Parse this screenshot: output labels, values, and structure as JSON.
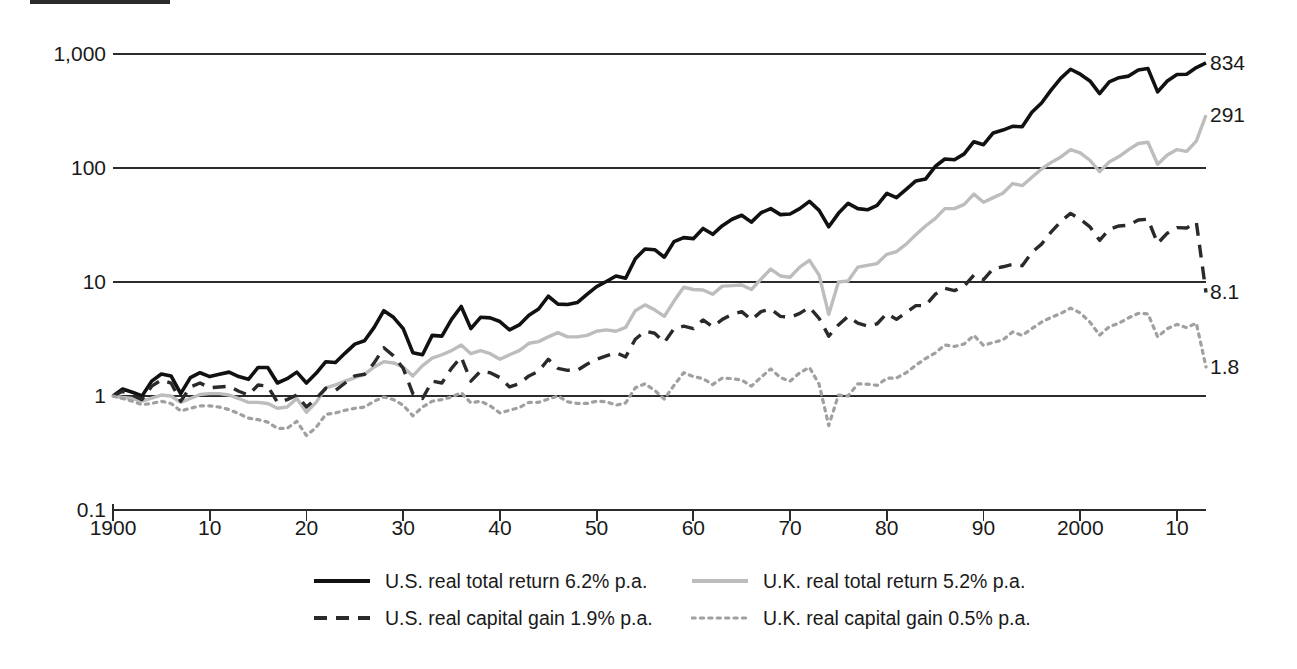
{
  "figure": {
    "top_rule": "decorative-rule"
  },
  "chart_data": {
    "type": "line",
    "title": "",
    "subtitle": "",
    "xlabel": "",
    "ylabel": "",
    "yscale": "log",
    "ylim": [
      0.1,
      1000
    ],
    "xlim": [
      1900,
      2013
    ],
    "grid": true,
    "legend_position": "bottom",
    "y_ticks": [
      0.1,
      1,
      10,
      100,
      1000
    ],
    "y_tick_labels": [
      "0.1",
      "1",
      "10",
      "100",
      "1,000"
    ],
    "x_ticks": [
      1900,
      1910,
      1920,
      1930,
      1940,
      1950,
      1960,
      1970,
      1980,
      1990,
      2000,
      2010
    ],
    "x_tick_labels": [
      "1900",
      "10",
      "20",
      "30",
      "40",
      "50",
      "60",
      "70",
      "80",
      "90",
      "2000",
      "10"
    ],
    "end_labels": [
      {
        "series": "U.S. real total return",
        "text": "834",
        "value": 834
      },
      {
        "series": "U.K. real total return",
        "text": "291",
        "value": 291
      },
      {
        "series": "U.S. real capital gain",
        "text": "8.1",
        "value": 8.1
      },
      {
        "series": "U.K. real capital gain",
        "text": "1.8",
        "value": 1.8
      }
    ],
    "x": [
      1900,
      1901,
      1902,
      1903,
      1904,
      1905,
      1906,
      1907,
      1908,
      1909,
      1910,
      1911,
      1912,
      1913,
      1914,
      1915,
      1916,
      1917,
      1918,
      1919,
      1920,
      1921,
      1922,
      1923,
      1924,
      1925,
      1926,
      1927,
      1928,
      1929,
      1930,
      1931,
      1932,
      1933,
      1934,
      1935,
      1936,
      1937,
      1938,
      1939,
      1940,
      1941,
      1942,
      1943,
      1944,
      1945,
      1946,
      1947,
      1948,
      1949,
      1950,
      1951,
      1952,
      1953,
      1954,
      1955,
      1956,
      1957,
      1958,
      1959,
      1960,
      1961,
      1962,
      1963,
      1964,
      1965,
      1966,
      1967,
      1968,
      1969,
      1970,
      1971,
      1972,
      1973,
      1974,
      1975,
      1976,
      1977,
      1978,
      1979,
      1980,
      1981,
      1982,
      1983,
      1984,
      1985,
      1986,
      1987,
      1988,
      1989,
      1990,
      1991,
      1992,
      1993,
      1994,
      1995,
      1996,
      1997,
      1998,
      1999,
      2000,
      2001,
      2002,
      2003,
      2004,
      2005,
      2006,
      2007,
      2008,
      2009,
      2010,
      2011,
      2012,
      2013
    ],
    "series": [
      {
        "name": "U.S. real total return 6.2% p.a.",
        "label": "U.S. real total return",
        "rate": "6.2% p.a.",
        "color": "#111111",
        "style": "solid",
        "width": 3.6,
        "values": [
          1,
          1.15,
          1.08,
          1.0,
          1.35,
          1.56,
          1.5,
          1.05,
          1.45,
          1.6,
          1.48,
          1.55,
          1.62,
          1.48,
          1.4,
          1.78,
          1.78,
          1.3,
          1.42,
          1.62,
          1.3,
          1.58,
          2.0,
          1.97,
          2.38,
          2.85,
          3.05,
          4.0,
          5.6,
          4.9,
          3.9,
          2.4,
          2.3,
          3.4,
          3.35,
          4.7,
          6.1,
          3.9,
          4.9,
          4.85,
          4.5,
          3.8,
          4.2,
          5.1,
          5.8,
          7.5,
          6.4,
          6.35,
          6.6,
          7.8,
          9.1,
          10.1,
          11.3,
          10.8,
          16.0,
          19.5,
          19.2,
          16.5,
          22.6,
          24.5,
          24.0,
          29.5,
          26.2,
          31.2,
          35.5,
          38.5,
          33.5,
          40.5,
          44.0,
          39.0,
          39.5,
          44.0,
          51.0,
          42.5,
          30.5,
          40.0,
          49.0,
          44.0,
          43.0,
          47.0,
          60.0,
          55.0,
          65.0,
          77.0,
          80.0,
          103.0,
          120.0,
          118.0,
          133.0,
          170.0,
          160.0,
          203.0,
          215.0,
          232.0,
          230.0,
          308.0,
          372.0,
          485.0,
          615.0,
          735.0,
          665.0,
          580.0,
          450.0,
          570.0,
          620.0,
          640.0,
          725.0,
          745.0,
          465.0,
          580.0,
          660.0,
          665.0,
          760.0,
          834.0
        ]
      },
      {
        "name": "U.K. real total return 5.2% p.a.",
        "label": "U.K. real total return",
        "rate": "5.2% p.a.",
        "color": "#bdbdbd",
        "style": "solid",
        "width": 3.4,
        "values": [
          1,
          0.97,
          0.95,
          0.9,
          0.96,
          1.02,
          1.0,
          0.88,
          0.95,
          1.03,
          1.05,
          1.05,
          1.02,
          0.95,
          0.88,
          0.88,
          0.86,
          0.78,
          0.8,
          0.95,
          0.72,
          0.88,
          1.18,
          1.25,
          1.35,
          1.45,
          1.55,
          1.8,
          2.0,
          1.95,
          1.8,
          1.5,
          1.85,
          2.15,
          2.3,
          2.5,
          2.8,
          2.35,
          2.5,
          2.35,
          2.1,
          2.3,
          2.5,
          2.9,
          3.0,
          3.3,
          3.6,
          3.3,
          3.3,
          3.4,
          3.7,
          3.8,
          3.7,
          4.0,
          5.6,
          6.3,
          5.7,
          5.0,
          6.8,
          9.0,
          8.6,
          8.5,
          7.8,
          9.2,
          9.3,
          9.4,
          8.6,
          10.6,
          13.0,
          11.3,
          11.0,
          13.5,
          15.5,
          11.5,
          5.2,
          10.0,
          10.2,
          13.5,
          14.0,
          14.5,
          17.5,
          18.5,
          21.5,
          26.0,
          31.0,
          36.0,
          44.0,
          44.0,
          48.0,
          59.0,
          50.0,
          55.0,
          60.0,
          73.0,
          70.0,
          83.0,
          98.0,
          112.0,
          125.0,
          145.0,
          136.0,
          117.0,
          93.0,
          113.0,
          126.0,
          145.0,
          164.0,
          168.0,
          108.0,
          130.0,
          145.0,
          140.0,
          172.0,
          291.0
        ]
      },
      {
        "name": "U.S. real capital gain 1.9% p.a.",
        "label": "U.S. real capital gain",
        "rate": "1.9% p.a.",
        "color": "#2a2a2a",
        "style": "dashed",
        "width": 3.4,
        "values": [
          1,
          1.1,
          1.02,
          0.93,
          1.22,
          1.38,
          1.3,
          0.9,
          1.2,
          1.3,
          1.18,
          1.2,
          1.22,
          1.1,
          1.02,
          1.25,
          1.22,
          0.88,
          0.93,
          1.02,
          0.8,
          0.95,
          1.17,
          1.12,
          1.3,
          1.5,
          1.55,
          1.95,
          2.65,
          2.25,
          1.75,
          1.05,
          0.95,
          1.35,
          1.3,
          1.75,
          2.2,
          1.35,
          1.65,
          1.6,
          1.45,
          1.2,
          1.28,
          1.5,
          1.65,
          2.1,
          1.75,
          1.68,
          1.68,
          1.9,
          2.1,
          2.25,
          2.4,
          2.2,
          3.15,
          3.7,
          3.55,
          2.95,
          3.9,
          4.1,
          3.9,
          4.65,
          4.05,
          4.7,
          5.2,
          5.5,
          4.65,
          5.5,
          5.8,
          5.0,
          4.9,
          5.3,
          6.0,
          4.8,
          3.35,
          4.2,
          5.0,
          4.35,
          4.1,
          4.3,
          5.3,
          4.7,
          5.4,
          6.2,
          6.2,
          7.8,
          8.8,
          8.4,
          9.2,
          11.5,
          10.5,
          13.1,
          13.6,
          14.3,
          13.9,
          18.2,
          21.5,
          27.5,
          34.0,
          40.0,
          35.5,
          30.5,
          23.2,
          29.0,
          31.0,
          31.5,
          35.0,
          35.5,
          21.8,
          26.8,
          30.0,
          29.8,
          33.5,
          8.1
        ]
      },
      {
        "name": "U.K. real capital gain 0.5% p.a.",
        "label": "U.K. real capital gain",
        "rate": "0.5% p.a.",
        "color": "#a0a0a0",
        "style": "dotted",
        "width": 3.2,
        "values": [
          1,
          0.95,
          0.9,
          0.84,
          0.86,
          0.9,
          0.86,
          0.74,
          0.78,
          0.82,
          0.82,
          0.8,
          0.76,
          0.7,
          0.64,
          0.62,
          0.59,
          0.52,
          0.52,
          0.6,
          0.45,
          0.53,
          0.69,
          0.71,
          0.75,
          0.78,
          0.8,
          0.9,
          0.98,
          0.93,
          0.83,
          0.67,
          0.8,
          0.9,
          0.93,
          0.98,
          1.07,
          0.87,
          0.9,
          0.82,
          0.71,
          0.75,
          0.79,
          0.88,
          0.88,
          0.94,
          1.0,
          0.89,
          0.86,
          0.86,
          0.9,
          0.89,
          0.83,
          0.87,
          1.18,
          1.28,
          1.12,
          0.94,
          1.24,
          1.6,
          1.48,
          1.42,
          1.26,
          1.44,
          1.42,
          1.38,
          1.22,
          1.46,
          1.73,
          1.45,
          1.35,
          1.6,
          1.78,
          1.27,
          0.55,
          1.02,
          1.0,
          1.28,
          1.27,
          1.24,
          1.43,
          1.44,
          1.6,
          1.86,
          2.13,
          2.38,
          2.8,
          2.72,
          2.86,
          3.4,
          2.78,
          2.95,
          3.1,
          3.65,
          3.4,
          3.9,
          4.45,
          4.9,
          5.3,
          5.9,
          5.35,
          4.45,
          3.42,
          4.05,
          4.35,
          4.85,
          5.3,
          5.25,
          3.3,
          3.9,
          4.25,
          3.98,
          4.35,
          1.8
        ]
      }
    ]
  },
  "legend": {
    "rows": [
      [
        {
          "label": "U.S. real total return 6.2% p.a.",
          "style": "solid",
          "color": "#111111"
        },
        {
          "label": "U.K. real total return 5.2% p.a.",
          "style": "solid",
          "color": "#bdbdbd"
        }
      ],
      [
        {
          "label": "U.S. real capital gain 1.9% p.a.",
          "style": "dashed",
          "color": "#2a2a2a"
        },
        {
          "label": "U.K. real capital gain 0.5% p.a.",
          "style": "dotted",
          "color": "#a0a0a0"
        }
      ]
    ]
  }
}
